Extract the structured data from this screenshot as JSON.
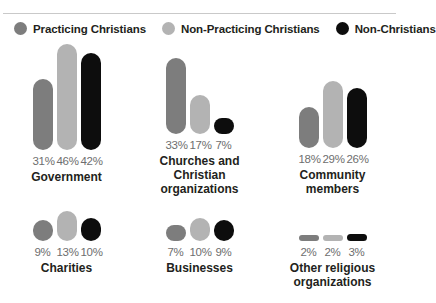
{
  "top_caption": "",
  "legend": {
    "items": [
      {
        "label": "Practicing Christians",
        "color": "#7d7d7d",
        "icon": "legend-dot-icon"
      },
      {
        "label": "Non-Practicing Christians",
        "color": "#b3b3b3",
        "icon": "legend-dot-icon"
      },
      {
        "label": "Non-Christians",
        "color": "#0d0d0d",
        "icon": "legend-dot-icon"
      }
    ]
  },
  "chart_data": {
    "type": "bar",
    "title": "",
    "xlabel": "",
    "ylabel": "",
    "ylim": [
      0,
      50
    ],
    "grid": false,
    "legend_position": "top",
    "categories": [
      "Government",
      "Churches and Christian organizations",
      "Community members",
      "Charities",
      "Businesses",
      "Other religious organizations"
    ],
    "series": [
      {
        "name": "Practicing Christians",
        "color": "#7d7d7d",
        "values": [
          31,
          33,
          18,
          9,
          7,
          2
        ]
      },
      {
        "name": "Non-Practicing Christians",
        "color": "#b3b3b3",
        "values": [
          46,
          17,
          29,
          13,
          10,
          2
        ]
      },
      {
        "name": "Non-Christians",
        "color": "#0d0d0d",
        "values": [
          42,
          7,
          26,
          10,
          9,
          3
        ]
      }
    ],
    "value_labels": [
      [
        "31%",
        "46%",
        "42%"
      ],
      [
        "33%",
        "17%",
        "7%"
      ],
      [
        "18%",
        "29%",
        "26%"
      ],
      [
        "9%",
        "13%",
        "10%"
      ],
      [
        "7%",
        "10%",
        "9%"
      ],
      [
        "2%",
        "2%",
        "3%"
      ]
    ]
  },
  "groups": [
    {
      "label": "Government",
      "label_lines": [
        "Government"
      ],
      "values": [
        "31%",
        "46%",
        "42%"
      ],
      "nums": [
        31,
        46,
        42
      ]
    },
    {
      "label": "Churches and Christian organizations",
      "label_lines": [
        "Churches and",
        "Christian organizations"
      ],
      "values": [
        "33%",
        "17%",
        "7%"
      ],
      "nums": [
        33,
        17,
        7
      ]
    },
    {
      "label": "Community members",
      "label_lines": [
        "Community",
        "members"
      ],
      "values": [
        "18%",
        "29%",
        "26%"
      ],
      "nums": [
        18,
        29,
        26
      ]
    },
    {
      "label": "Charities",
      "label_lines": [
        "Charities"
      ],
      "values": [
        "9%",
        "13%",
        "10%"
      ],
      "nums": [
        9,
        13,
        10
      ]
    },
    {
      "label": "Businesses",
      "label_lines": [
        "Businesses"
      ],
      "values": [
        "7%",
        "10%",
        "9%"
      ],
      "nums": [
        7,
        10,
        9
      ]
    },
    {
      "label": "Other religious organizations",
      "label_lines": [
        "Other religious",
        "organizations"
      ],
      "values": [
        "2%",
        "2%",
        "3%"
      ],
      "nums": [
        2,
        2,
        3
      ]
    }
  ]
}
